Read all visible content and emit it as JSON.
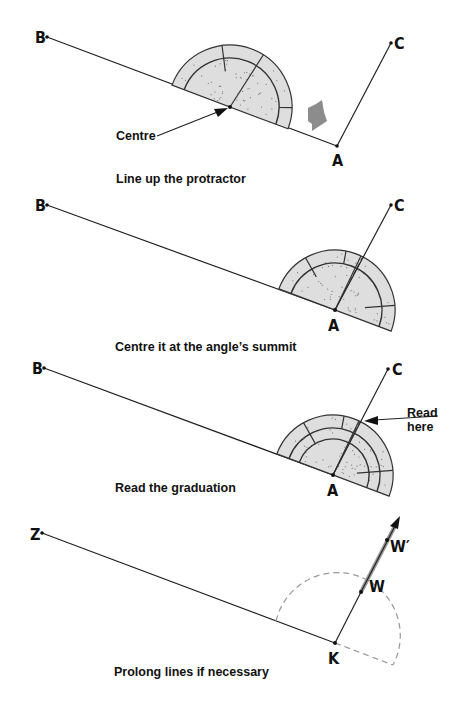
{
  "panels": [
    {
      "id": "line-up",
      "caption": "Line up the protractor",
      "points": {
        "B": "B",
        "A": "A",
        "C": "C"
      },
      "pointer_label": "Centre",
      "has_motion_arrow": true
    },
    {
      "id": "centre-it",
      "caption": "Centre it at the angle’s summit",
      "points": {
        "B": "B",
        "A": "A",
        "C": "C"
      }
    },
    {
      "id": "read-graduation",
      "caption": "Read the graduation",
      "points": {
        "B": "B",
        "A": "A",
        "C": "C"
      },
      "pointer_label_line1": "Read",
      "pointer_label_line2": "here"
    },
    {
      "id": "prolong-lines",
      "caption": "Prolong lines if necessary",
      "points": {
        "Z": "Z",
        "K": "K",
        "W": "W",
        "W_prime": "W′"
      }
    }
  ],
  "colors": {
    "ink": "#111111",
    "protractor_fill": "#dedede",
    "motion_arrow": "#8c8c8c",
    "dashed_guide": "#999999"
  }
}
